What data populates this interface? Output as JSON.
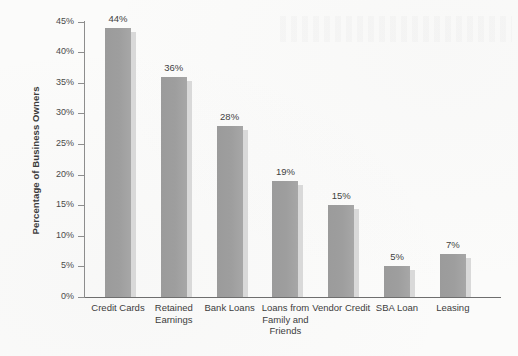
{
  "chart_data": {
    "type": "bar",
    "title": "",
    "xlabel": "",
    "ylabel": "Percentage of Business Owners",
    "ylim": [
      0,
      45
    ],
    "ytick_labels": [
      "45%",
      "40%",
      "35%",
      "30%",
      "25%",
      "20%",
      "15%",
      "10%",
      "5%",
      "0%"
    ],
    "ytick_values": [
      45,
      40,
      35,
      30,
      25,
      20,
      15,
      10,
      5,
      0
    ],
    "grid": false,
    "legend": "none",
    "categories": [
      "Credit Cards",
      "Retained\nEarnings",
      "Bank Loans",
      "Loans from\nFamily and\nFriends",
      "Vendor Credit",
      "SBA Loan",
      "Leasing"
    ],
    "values": [
      44,
      36,
      28,
      19,
      15,
      5,
      7
    ],
    "value_labels": [
      "44%",
      "36%",
      "28%",
      "19%",
      "15%",
      "5%",
      "7%"
    ],
    "series": [
      {
        "name": "Percentage of Business Owners",
        "values": [
          44,
          36,
          28,
          19,
          15,
          5,
          7
        ]
      }
    ],
    "colors": {
      "bar_fill": "#9e9e9e",
      "bar_shadow": "#d9d9d9",
      "axis": "#8d8d8d",
      "baseline": "#6e6e6e",
      "text": "#3d3d3d",
      "background": "#fbfbfa"
    }
  }
}
